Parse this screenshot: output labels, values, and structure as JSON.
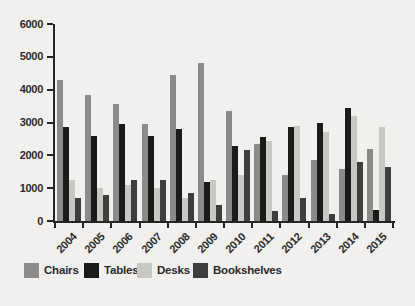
{
  "page": {
    "background": "#f1f0ee",
    "text_color": "#2b2b2b",
    "axis_color": "#262626"
  },
  "chart_data": {
    "type": "bar",
    "title": "",
    "xlabel": "",
    "ylabel": "",
    "categories": [
      "2004",
      "2005",
      "2006",
      "2007",
      "2008",
      "2009",
      "2010",
      "2011",
      "2012",
      "2013",
      "2014",
      "2015"
    ],
    "series": [
      {
        "name": "Chairs",
        "color": "#8b8b8b",
        "values": [
          4300,
          3850,
          3550,
          2950,
          4450,
          4800,
          3350,
          2350,
          1400,
          1850,
          1600,
          2200
        ]
      },
      {
        "name": "Tables",
        "color": "#1b1b1b",
        "values": [
          2850,
          2600,
          2950,
          2600,
          2800,
          1200,
          2300,
          2550,
          2850,
          3000,
          3450,
          350
        ]
      },
      {
        "name": "Desks",
        "color": "#c8c7c4",
        "values": [
          1250,
          1000,
          1100,
          1000,
          700,
          1250,
          1400,
          2450,
          2900,
          2700,
          3200,
          2850
        ]
      },
      {
        "name": "Bookshelves",
        "color": "#3e3e3e",
        "values": [
          700,
          800,
          1250,
          1250,
          850,
          500,
          2150,
          300,
          700,
          200,
          1800,
          1650
        ]
      }
    ],
    "ylim": [
      0,
      6000
    ],
    "yticks": [
      0,
      1000,
      2000,
      3000,
      4000,
      5000,
      6000
    ],
    "grid": false,
    "legend_position": "bottom"
  }
}
